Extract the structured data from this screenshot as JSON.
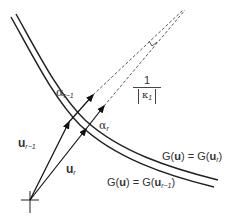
{
  "diagram": {
    "type": "geometric-vector-diagram",
    "colors": {
      "stroke": "#222222",
      "text": "#333333",
      "background": "#ffffff"
    },
    "labels": {
      "alpha_prev": {
        "symbol": "α",
        "sub": "r−1"
      },
      "alpha_curr": {
        "symbol": "α",
        "sub": "r"
      },
      "curvature_num": "1",
      "curvature_den_symbol": "κ",
      "curvature_den_sub": "1",
      "u_prev": {
        "symbol": "u",
        "sub": "r−1"
      },
      "u_curr": {
        "symbol": "u",
        "sub": "r"
      },
      "contour_curr": {
        "prefix": "G(",
        "arg": "u",
        "mid": ") = G(",
        "arg2": "u",
        "sub": "r",
        "suffix": ")"
      },
      "contour_prev": {
        "prefix": "G(",
        "arg": "u",
        "mid": ") = G(",
        "arg2": "u",
        "sub": "r−1",
        "suffix": ")"
      }
    },
    "elements": [
      "origin-cross",
      "vector-u-r-minus-1",
      "vector-u-r",
      "contour-curve-G-u-r",
      "contour-curve-G-u-r-minus-1",
      "dashed-extension-lines",
      "right-angle-marker",
      "direction-arrow-alpha-r-minus-1",
      "direction-arrow-alpha-r"
    ]
  }
}
